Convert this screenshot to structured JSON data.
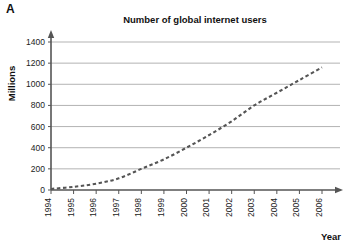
{
  "panel": {
    "label": "A"
  },
  "axis_titles": {
    "y": "Millions",
    "x": "Year"
  },
  "chart_data": {
    "type": "line",
    "title": "Number of global internet users",
    "xlabel": "Year",
    "ylabel": "Millions",
    "x": [
      1994,
      1995,
      1996,
      1997,
      1998,
      1999,
      2000,
      2001,
      2002,
      2003,
      2004,
      2005,
      2006
    ],
    "categories": [
      "1994",
      "1995",
      "1996",
      "1997",
      "1998",
      "1999",
      "2000",
      "2001",
      "2002",
      "2003",
      "2004",
      "2005",
      "2006"
    ],
    "values": [
      10,
      30,
      60,
      110,
      200,
      290,
      400,
      520,
      650,
      800,
      920,
      1040,
      1160
    ],
    "series": [
      {
        "name": "Global internet users",
        "values": [
          10,
          30,
          60,
          110,
          200,
          290,
          400,
          520,
          650,
          800,
          920,
          1040,
          1160
        ]
      }
    ],
    "xlim": [
      1994,
      2006
    ],
    "ylim": [
      0,
      1400
    ],
    "yticks": [
      0,
      200,
      400,
      600,
      800,
      1000,
      1200,
      1400
    ],
    "ytick_labels": [
      "0",
      "200",
      "400",
      "600",
      "800",
      "1000",
      "1200",
      "1400"
    ],
    "grid": true,
    "grid_axis": "y",
    "legend": "none",
    "line_style": "dashed",
    "line_color": "#555555",
    "grid_color": "#aaaaaa",
    "axis_color": "#555555",
    "x_tick_rotation": -90
  }
}
